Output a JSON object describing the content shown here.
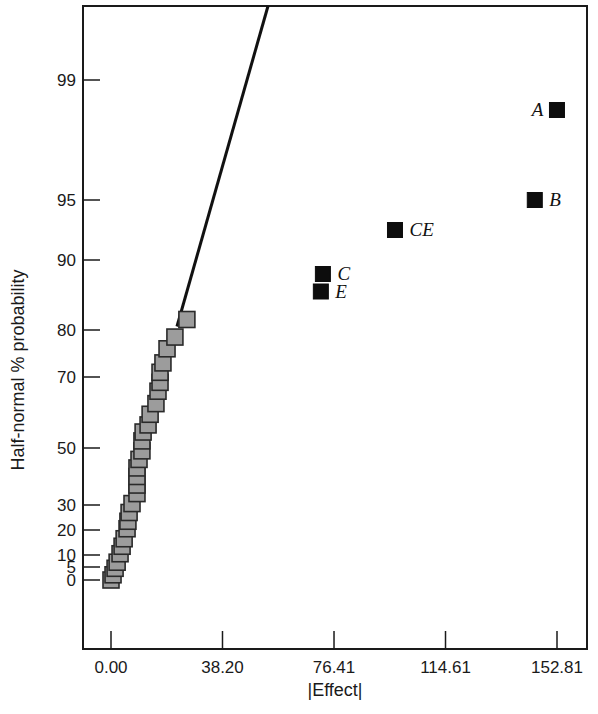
{
  "chart_data": {
    "type": "scatter",
    "title": "",
    "xlabel": "|Effect|",
    "ylabel": "Half-normal % probability",
    "xlim": [
      -9.5,
      162
    ],
    "x_ticks": [
      {
        "value": 0.0,
        "label": "0.00"
      },
      {
        "value": 38.2,
        "label": "38.20"
      },
      {
        "value": 76.41,
        "label": "76.41"
      },
      {
        "value": 114.61,
        "label": "114.61"
      },
      {
        "value": 152.81,
        "label": "152.81"
      }
    ],
    "y_ticks": [
      {
        "value": 0,
        "label": "0"
      },
      {
        "value": 5,
        "label": "5"
      },
      {
        "value": 10,
        "label": "10"
      },
      {
        "value": 20,
        "label": "20"
      },
      {
        "value": 30,
        "label": "30"
      },
      {
        "value": 50,
        "label": "50"
      },
      {
        "value": 70,
        "label": "70"
      },
      {
        "value": 80,
        "label": "80"
      },
      {
        "value": 90,
        "label": "90"
      },
      {
        "value": 95,
        "label": "95"
      },
      {
        "value": 99,
        "label": "99"
      }
    ],
    "y_scale": "half-normal probability",
    "grid": false,
    "legend": null,
    "fit_line": {
      "from": {
        "effect": 22.6,
        "prob": 80.5
      },
      "to": {
        "effect": 53.8,
        "prob": 99.9
      }
    },
    "series": [
      {
        "name": "Insignificant effects (error)",
        "marker": "gray-square",
        "points": [
          {
            "effect": 0.0,
            "prob": 0.0
          },
          {
            "effect": 0.7,
            "prob": 2.0
          },
          {
            "effect": 1.4,
            "prob": 4.5
          },
          {
            "effect": 2.1,
            "prob": 7.0
          },
          {
            "effect": 3.1,
            "prob": 10.5
          },
          {
            "effect": 3.8,
            "prob": 13.5
          },
          {
            "effect": 4.5,
            "prob": 16.5
          },
          {
            "effect": 5.5,
            "prob": 20.5
          },
          {
            "effect": 5.8,
            "prob": 23.5
          },
          {
            "effect": 6.2,
            "prob": 27.0
          },
          {
            "effect": 7.2,
            "prob": 30.5
          },
          {
            "effect": 8.9,
            "prob": 34.0
          },
          {
            "effect": 8.9,
            "prob": 37.0
          },
          {
            "effect": 8.9,
            "prob": 40.0
          },
          {
            "effect": 8.9,
            "prob": 43.0
          },
          {
            "effect": 9.6,
            "prob": 46.0
          },
          {
            "effect": 10.6,
            "prob": 49.0
          },
          {
            "effect": 10.6,
            "prob": 52.0
          },
          {
            "effect": 11.0,
            "prob": 54.5
          },
          {
            "effect": 12.7,
            "prob": 56.5
          },
          {
            "effect": 13.4,
            "prob": 59.5
          },
          {
            "effect": 15.4,
            "prob": 62.5
          },
          {
            "effect": 16.1,
            "prob": 66.0
          },
          {
            "effect": 16.8,
            "prob": 68.5
          },
          {
            "effect": 16.8,
            "prob": 71.0
          },
          {
            "effect": 17.8,
            "prob": 73.0
          },
          {
            "effect": 19.2,
            "prob": 76.0
          },
          {
            "effect": 21.9,
            "prob": 78.5
          },
          {
            "effect": 26.0,
            "prob": 81.5
          }
        ]
      },
      {
        "name": "Significant effects",
        "marker": "black-square",
        "points": [
          {
            "label": "A",
            "effect": 152.8,
            "prob": 98.0,
            "label_side": "left"
          },
          {
            "label": "B",
            "effect": 145.2,
            "prob": 95.0,
            "label_side": "right"
          },
          {
            "label": "CE",
            "effect": 97.3,
            "prob": 92.5,
            "label_side": "right"
          },
          {
            "label": "C",
            "effect": 72.6,
            "prob": 88.0,
            "label_side": "right"
          },
          {
            "label": "E",
            "effect": 71.9,
            "prob": 85.5,
            "label_side": "right"
          }
        ]
      }
    ]
  },
  "colors": {
    "gray_marker": "#9c9c9c",
    "black_marker": "#0d0d0d",
    "axis": "#1a1a1a"
  }
}
